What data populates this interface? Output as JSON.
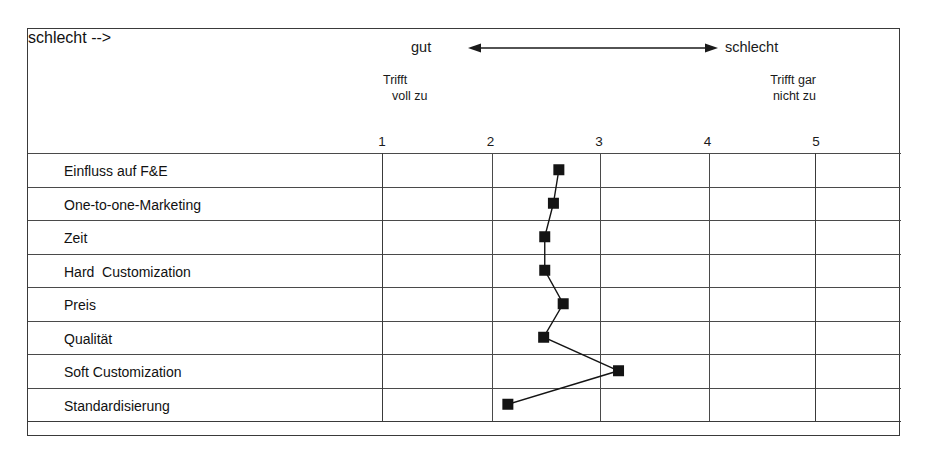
{
  "scale": {
    "good_label": "gut",
    "bad_label": "schlecht",
    "arrow_icon": "double-headed-arrow-icon"
  },
  "anchors": {
    "left_line1": "Trifft",
    "left_line2": "voll zu",
    "right_line1": "Trifft gar",
    "right_line2": "nicht zu"
  },
  "chart_data": {
    "type": "line",
    "orientation": "horizontal",
    "title": "",
    "subtitle": "",
    "xlabel": "",
    "ylabel": "",
    "xlim": [
      1,
      5
    ],
    "xticks": [
      1,
      2,
      3,
      4,
      5
    ],
    "xtick_labels": [
      "1",
      "2",
      "3",
      "4",
      "5"
    ],
    "grid": true,
    "legend_position": "none",
    "marker": "filled-square",
    "marker_color": "#141414",
    "line_color": "#141414",
    "scale_anchor_low": "Trifft voll zu",
    "scale_anchor_high": "Trifft gar nicht zu",
    "scale_direction_low": "gut",
    "scale_direction_high": "schlecht",
    "categories": [
      "Einfluss auf F&E",
      "One-to-one-Marketing",
      "Zeit",
      "Hard  Customization",
      "Preis",
      "Qualität",
      "Soft Customization",
      "Standardisierung"
    ],
    "values": [
      2.63,
      2.58,
      2.5,
      2.5,
      2.67,
      2.49,
      3.18,
      2.16
    ]
  }
}
